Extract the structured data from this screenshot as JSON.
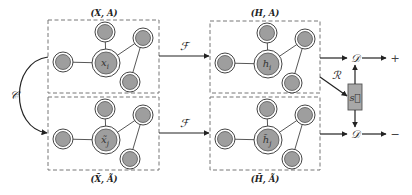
{
  "diagram": {
    "groups": [
      {
        "id": "input-original",
        "label": "(X, A)",
        "center_label": "x_i"
      },
      {
        "id": "input-corrupted",
        "label": "(X̃, Ã)",
        "center_label": "x̃_j"
      },
      {
        "id": "embed-original",
        "label": "(H, A)",
        "center_label": "h_i"
      },
      {
        "id": "embed-corrupted",
        "label": "(H̃, Ã)",
        "center_label": "h̃_j"
      }
    ],
    "node_label_parts": {
      "x_i": {
        "base": "x",
        "sub": "i"
      },
      "x̃_j": {
        "base": "x̃",
        "sub": "j"
      },
      "h_i": {
        "base": "h",
        "sub": "i"
      },
      "h̃_j": {
        "base": "h̃",
        "sub": "j"
      }
    },
    "operators": {
      "corruption": "𝒞",
      "encoder_top": "ℱ",
      "encoder_bottom": "ℱ",
      "readout": "ℛ",
      "discriminator_top": "𝒟",
      "discriminator_bottom": "𝒟"
    },
    "summary_vector": "s⃗",
    "outputs": {
      "positive": "+",
      "negative": "−"
    },
    "colors": {
      "node_fill": "#9e9e9e",
      "summary_fill": "#a8a8a8",
      "box_stroke": "#777777",
      "arrow": "#222222"
    }
  }
}
